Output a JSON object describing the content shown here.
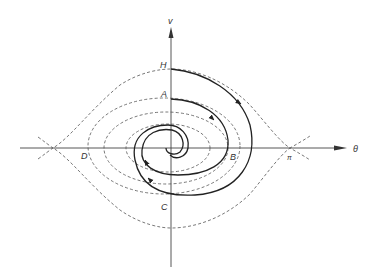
{
  "diagram": {
    "type": "phase-portrait",
    "axes": {
      "vertical_label": "v",
      "horizontal_label": "θ",
      "pi_label": "π"
    },
    "points": {
      "H": "H",
      "A": "A",
      "B": "B",
      "C": "C",
      "D": "D"
    },
    "curves": {
      "dashed": [
        "separatrix",
        "orbit-outer",
        "orbit-middle",
        "orbit-inner"
      ],
      "solid": [
        "damped-spiral-from-H",
        "damped-spiral-from-A"
      ]
    },
    "colors": {
      "axis": "#444444",
      "dashed": "#555555",
      "solid": "#222222"
    }
  }
}
